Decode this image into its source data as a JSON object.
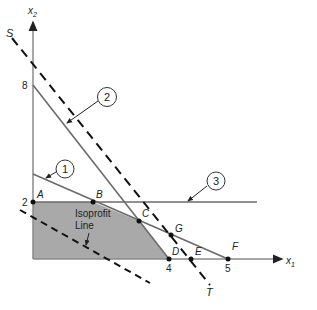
{
  "diagram": {
    "type": "linear-programming-graphical-solution",
    "axes": {
      "x_label": "x",
      "x_sub": "1",
      "y_label": "x",
      "y_sub": "2",
      "y_ticks": [
        "8",
        "2"
      ],
      "x_ticks": [
        "4",
        "5"
      ]
    },
    "constraints": [
      {
        "id": "1",
        "label": "1"
      },
      {
        "id": "2",
        "label": "2"
      },
      {
        "id": "3",
        "label": "3"
      }
    ],
    "points": {
      "A": "A",
      "B": "B",
      "C": "C",
      "D": "D",
      "E": "E",
      "F": "F",
      "G": "G"
    },
    "line_labels": {
      "S": "S",
      "T": "T"
    },
    "isoprofit": {
      "line1": "Isoprofit",
      "line2": "Line"
    },
    "colors": {
      "feasible_region": "#a9a9a9",
      "constraint_line": "#6b6b6b",
      "axis": "#8a8a8a",
      "dashed": "#111111"
    }
  }
}
